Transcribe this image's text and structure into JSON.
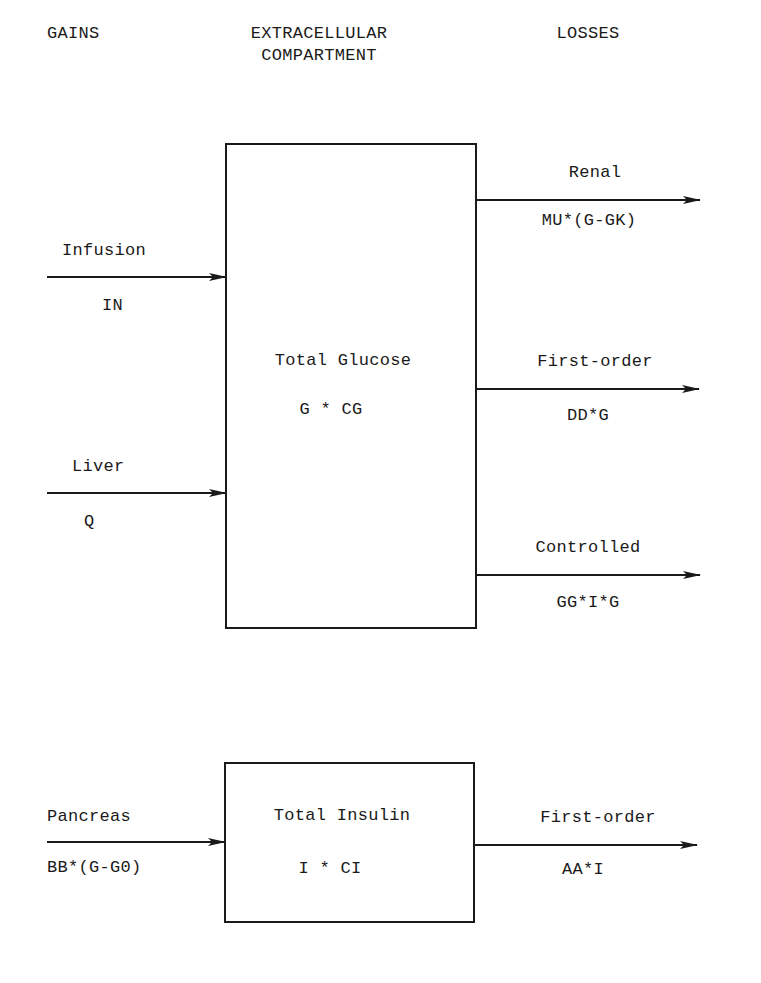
{
  "headers": {
    "gains": "GAINS",
    "compartment_line1": "EXTRACELLULAR",
    "compartment_line2": "COMPARTMENT",
    "losses": "LOSSES"
  },
  "glucose": {
    "title": "Total Glucose",
    "expr": "G * CG",
    "gains": [
      {
        "label": "Infusion",
        "expr": "IN"
      },
      {
        "label": "Liver",
        "expr": "Q"
      }
    ],
    "losses": [
      {
        "label": "Renal",
        "expr": "MU*(G-GK)"
      },
      {
        "label": "First-order",
        "expr": "DD*G"
      },
      {
        "label": "Controlled",
        "expr": "GG*I*G"
      }
    ]
  },
  "insulin": {
    "title": "Total Insulin",
    "expr": "I * CI",
    "gains": [
      {
        "label": "Pancreas",
        "expr": "BB*(G-G0)"
      }
    ],
    "losses": [
      {
        "label": "First-order",
        "expr": "AA*I"
      }
    ]
  },
  "colors": {
    "ink": "#1a1a1a",
    "background": "#ffffff"
  }
}
